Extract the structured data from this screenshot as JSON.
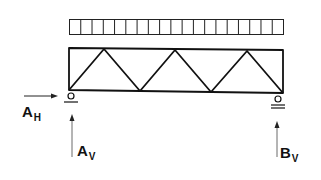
{
  "diagram": {
    "type": "truss-with-distributed-load",
    "distributed_load": {
      "segments": 19
    },
    "truss": {
      "panels": 3,
      "web": "warren"
    },
    "supports": [
      {
        "name": "pin-support-A",
        "position": "left"
      },
      {
        "name": "roller-support-B",
        "position": "right"
      }
    ],
    "labels": {
      "ah": {
        "main": "A",
        "sub": "H"
      },
      "av": {
        "main": "A",
        "sub": "V"
      },
      "bv": {
        "main": "B",
        "sub": "V"
      }
    },
    "colors": {
      "line": "#111111",
      "background": "#ffffff"
    }
  }
}
